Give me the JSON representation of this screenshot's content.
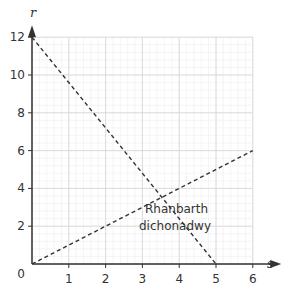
{
  "chart_data": {
    "type": "line",
    "title": "",
    "xlabel": "s",
    "ylabel": "r",
    "xlim": [
      0,
      6
    ],
    "ylim": [
      0,
      12
    ],
    "x_ticks": [
      "1",
      "2",
      "3",
      "4",
      "5",
      "6"
    ],
    "y_ticks": [
      "0",
      "2",
      "4",
      "6",
      "8",
      "10",
      "12"
    ],
    "grid": true,
    "series": [
      {
        "name": "line-1",
        "style": "dashed",
        "points": [
          [
            0,
            12
          ],
          [
            5,
            0
          ]
        ]
      },
      {
        "name": "line-2",
        "style": "dashed",
        "points": [
          [
            0,
            0
          ],
          [
            6,
            6
          ]
        ]
      }
    ],
    "annotations": [
      {
        "text_line1": "Rhanbarth",
        "text_line2": "dichonadwy",
        "x": 3.8,
        "y": 1.5
      }
    ],
    "legend": null
  },
  "colors": {
    "axis": "#333333",
    "grid_major": "#d8d8d8",
    "grid_minor": "#eeeeee",
    "line": "#333333"
  }
}
